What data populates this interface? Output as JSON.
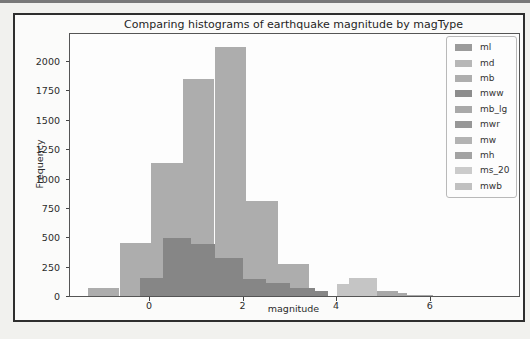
{
  "page": {
    "top_rule_color": "#787878",
    "frame_border_color": "#2e2e2e"
  },
  "chart_data": {
    "type": "bar",
    "subtype": "overlaid-histograms",
    "title": "Comparing histograms of earthquake magnitude by magType",
    "xlabel": "magnitude",
    "ylabel": "Frequency",
    "xlim": [
      -1.69,
      7.91
    ],
    "ylim": [
      0,
      2230
    ],
    "x_ticks": [
      0,
      2,
      4,
      6
    ],
    "y_ticks": [
      0,
      250,
      500,
      750,
      1000,
      1250,
      1500,
      1750,
      2000
    ],
    "grid": false,
    "legend_position": "upper right",
    "legend": [
      {
        "label": "ml",
        "color": "#9b9b9b"
      },
      {
        "label": "md",
        "color": "#b7b7b7"
      },
      {
        "label": "mb",
        "color": "#aeaeae"
      },
      {
        "label": "mww",
        "color": "#8d8d8d"
      },
      {
        "label": "mb_lg",
        "color": "#a9a9a9"
      },
      {
        "label": "mwr",
        "color": "#979797"
      },
      {
        "label": "mw",
        "color": "#b3b3b3"
      },
      {
        "label": "mh",
        "color": "#a3a3a3"
      },
      {
        "label": "ms_20",
        "color": "#cbcbcb"
      },
      {
        "label": "mwb",
        "color": "#c0c0c0"
      }
    ],
    "series": [
      {
        "name": "large-light-histogram",
        "color": "#adadad",
        "bars": [
          {
            "x0": -1.3,
            "x1": -0.63,
            "h": 65
          },
          {
            "x0": -0.63,
            "x1": 0.05,
            "h": 450
          },
          {
            "x0": 0.05,
            "x1": 0.73,
            "h": 1130
          },
          {
            "x0": 0.73,
            "x1": 1.4,
            "h": 1850
          },
          {
            "x0": 1.4,
            "x1": 2.08,
            "h": 2120
          },
          {
            "x0": 2.08,
            "x1": 2.75,
            "h": 805
          },
          {
            "x0": 2.75,
            "x1": 3.43,
            "h": 270
          }
        ]
      },
      {
        "name": "dark-overlay-histogram",
        "color": "#868686",
        "bars": [
          {
            "x0": -0.2,
            "x1": 0.3,
            "h": 150
          },
          {
            "x0": 0.3,
            "x1": 0.9,
            "h": 490
          },
          {
            "x0": 0.9,
            "x1": 1.41,
            "h": 440
          },
          {
            "x0": 1.41,
            "x1": 2.01,
            "h": 325
          },
          {
            "x0": 2.01,
            "x1": 2.5,
            "h": 145
          },
          {
            "x0": 2.5,
            "x1": 3.01,
            "h": 115
          },
          {
            "x0": 3.01,
            "x1": 3.54,
            "h": 70
          },
          {
            "x0": 3.54,
            "x1": 3.83,
            "h": 45
          }
        ]
      },
      {
        "name": "right-tail-pale-histogram",
        "color": "#c5c5c5",
        "bars": [
          {
            "x0": 4.02,
            "x1": 4.28,
            "h": 105
          },
          {
            "x0": 4.28,
            "x1": 4.88,
            "h": 155
          }
        ]
      },
      {
        "name": "right-tail-medium-histogram",
        "color": "#a8a8a8",
        "bars": [
          {
            "x0": 4.88,
            "x1": 5.33,
            "h": 45
          },
          {
            "x0": 5.33,
            "x1": 5.52,
            "h": 22
          },
          {
            "x0": 5.52,
            "x1": 6.07,
            "h": 5
          }
        ]
      }
    ]
  }
}
